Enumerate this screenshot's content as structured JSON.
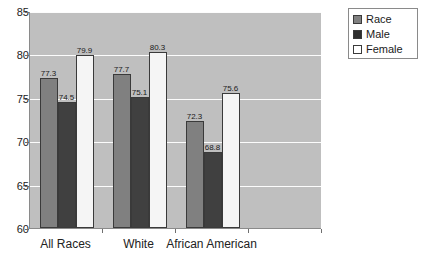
{
  "chart_data": {
    "type": "bar",
    "title": "",
    "subtitle": "",
    "xlabel": "",
    "ylabel": "",
    "ylim": [
      60,
      85
    ],
    "yticks": [
      60,
      65,
      70,
      75,
      80,
      85
    ],
    "grid": true,
    "legend_position": "top-right",
    "categories": [
      "All Races",
      "White",
      "African American"
    ],
    "series": [
      {
        "name": "Race",
        "color": "#808080",
        "values": [
          77.3,
          77.7,
          72.3
        ]
      },
      {
        "name": "Male",
        "color": "#404040",
        "values": [
          74.5,
          75.1,
          68.8
        ]
      },
      {
        "name": "Female",
        "color": "#f5f5f5",
        "values": [
          79.9,
          80.3,
          75.6
        ]
      }
    ],
    "data_labels": [
      [
        "77.3",
        "77.7",
        "72.3"
      ],
      [
        "74.5",
        "75.1",
        "68.8"
      ],
      [
        "79.9",
        "80.3",
        "75.6"
      ]
    ]
  },
  "axis": {
    "y_tick_labels": [
      "85",
      "80",
      "75",
      "70",
      "65",
      "60"
    ],
    "x_tick_labels": [
      "All Races",
      "White",
      "African American"
    ]
  },
  "legend": {
    "entries": [
      {
        "label": "Race"
      },
      {
        "label": "Male"
      },
      {
        "label": "Female"
      }
    ]
  },
  "colors": {
    "plot_background": "#bfbfbf",
    "gridline": "#fcfcfc",
    "axis_line": "#8a8a8a",
    "series_race": "#808080",
    "series_male": "#404040",
    "series_female": "#f5f5f5",
    "text": "#1a1a1a"
  }
}
